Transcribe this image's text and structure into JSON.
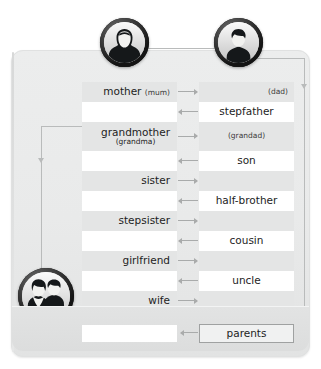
{
  "diagram": {
    "avatars": [
      {
        "name": "mother-avatar",
        "label": "female-avatar-icon"
      },
      {
        "name": "father-avatar",
        "label": "male-avatar-icon"
      },
      {
        "name": "couple-avatar",
        "label": "couple-avatar-icon"
      }
    ],
    "rows": [
      {
        "band": true,
        "tall": false,
        "left": "mother",
        "left_alt": "(mum)",
        "right": "(dad)",
        "right_small": true,
        "right_align": "end",
        "arrow": "right"
      },
      {
        "band": false,
        "tall": false,
        "left": "",
        "left_alt": "",
        "right": "stepfather",
        "right_small": false,
        "right_align": "center",
        "arrow": "left"
      },
      {
        "band": true,
        "tall": true,
        "left": "grandmother",
        "left_alt": "(grandma)",
        "right": "(grandad)",
        "right_small": true,
        "right_align": "center",
        "arrow": "right"
      },
      {
        "band": false,
        "tall": false,
        "left": "",
        "left_alt": "",
        "right": "son",
        "right_small": false,
        "right_align": "center",
        "arrow": "left"
      },
      {
        "band": true,
        "tall": false,
        "left": "sister",
        "left_alt": "",
        "right": "",
        "right_small": false,
        "right_align": "center",
        "arrow": "right"
      },
      {
        "band": false,
        "tall": false,
        "left": "",
        "left_alt": "",
        "right": "half-brother",
        "right_small": false,
        "right_align": "center",
        "arrow": "left"
      },
      {
        "band": true,
        "tall": false,
        "left": "stepsister",
        "left_alt": "",
        "right": "",
        "right_small": false,
        "right_align": "center",
        "arrow": "right"
      },
      {
        "band": false,
        "tall": false,
        "left": "",
        "left_alt": "",
        "right": "cousin",
        "right_small": false,
        "right_align": "center",
        "arrow": "left"
      },
      {
        "band": true,
        "tall": false,
        "left": "girlfriend",
        "left_alt": "",
        "right": "",
        "right_small": false,
        "right_align": "center",
        "arrow": "right"
      },
      {
        "band": false,
        "tall": false,
        "left": "",
        "left_alt": "",
        "right": "uncle",
        "right_small": false,
        "right_align": "center",
        "arrow": "left"
      },
      {
        "band": true,
        "tall": false,
        "left": "wife",
        "left_alt": "",
        "right": "",
        "right_small": false,
        "right_align": "center",
        "arrow": "right"
      }
    ],
    "footer": {
      "empty_label": "",
      "parents_label": "parents"
    },
    "colors": {
      "panel": "#e9eaea",
      "band": "#e4e5e5",
      "white": "#ffffff",
      "connector": "#b9bbbb",
      "arrow": "#a9abab",
      "text": "#1d1d1d"
    }
  }
}
